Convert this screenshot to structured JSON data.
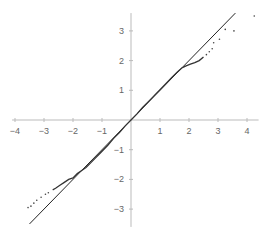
{
  "chart_data": {
    "type": "scatter",
    "title": "",
    "xlabel": "",
    "ylabel": "",
    "xlim": [
      -4.1,
      4.4
    ],
    "ylim": [
      -3.6,
      3.6
    ],
    "grid": false,
    "legend": null,
    "x_ticks": [
      -4,
      -3,
      -2,
      -1,
      1,
      2,
      3,
      4
    ],
    "y_ticks": [
      -3,
      -2,
      -1,
      1,
      2,
      3
    ],
    "reference_line": {
      "x": [
        -3.5,
        3.6
      ],
      "y": [
        -3.5,
        3.6
      ],
      "label": "y = x"
    },
    "series": [
      {
        "name": "sample quantiles",
        "style": "points-dense-curve",
        "x": [
          -3.55,
          -3.45,
          -3.35,
          -3.25,
          -3.1,
          -2.95,
          -2.85,
          -2.7,
          -2.6,
          -2.45,
          -2.3,
          -2.15,
          -2.0,
          -1.85,
          -1.7,
          -1.55,
          -1.4,
          -1.25,
          -1.1,
          -0.95,
          -0.8,
          -0.6,
          -0.4,
          -0.2,
          0.0,
          0.2,
          0.4,
          0.6,
          0.8,
          1.0,
          1.2,
          1.4,
          1.6,
          1.75,
          1.9,
          2.05,
          2.2,
          2.35,
          2.5,
          2.6,
          2.7,
          2.8,
          2.85,
          3.05,
          3.25,
          3.55,
          4.25
        ],
        "y": [
          -2.95,
          -2.9,
          -2.8,
          -2.7,
          -2.6,
          -2.5,
          -2.45,
          -2.35,
          -2.3,
          -2.2,
          -2.1,
          -2.0,
          -1.95,
          -1.8,
          -1.7,
          -1.6,
          -1.45,
          -1.3,
          -1.15,
          -1.0,
          -0.85,
          -0.62,
          -0.42,
          -0.2,
          0.0,
          0.2,
          0.42,
          0.62,
          0.82,
          1.02,
          1.22,
          1.42,
          1.62,
          1.75,
          1.82,
          1.88,
          1.93,
          2.0,
          2.12,
          2.2,
          2.3,
          2.4,
          2.6,
          2.72,
          3.05,
          3.0,
          3.5
        ]
      }
    ]
  }
}
